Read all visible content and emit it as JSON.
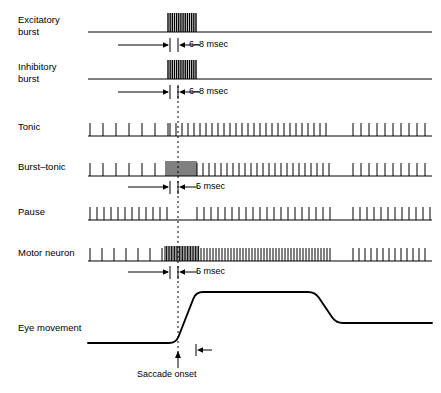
{
  "figure": {
    "background_color": "#ffffff",
    "ink_color": "#000000",
    "width": 441,
    "height": 393
  },
  "saccade_marker": {
    "label": "Saccade onset",
    "x": 178,
    "line_style": "dashed",
    "arrow": "up"
  },
  "rows": [
    {
      "id": "excitatory-burst",
      "label": "Excitatory\nburst",
      "label_x": 18,
      "label_y": 14,
      "baseline_y": 32,
      "trace_type": "burst-packet",
      "annotation": {
        "text": "6–8 msec",
        "left_arrow": true,
        "right_arrow": true,
        "y": 45
      }
    },
    {
      "id": "inhibitory-burst",
      "label": "Inhibitory\nburst",
      "label_x": 18,
      "label_y": 61,
      "baseline_y": 79,
      "trace_type": "burst-packet",
      "annotation": {
        "text": "6–8 msec",
        "left_arrow": true,
        "right_arrow": true,
        "y": 92
      }
    },
    {
      "id": "tonic",
      "label": "Tonic",
      "label_x": 18,
      "label_y": 121,
      "baseline_y": 136,
      "trace_type": "spike-train",
      "annotation": null
    },
    {
      "id": "burst-tonic",
      "label": "Burst–tonic",
      "label_x": 18,
      "label_y": 161,
      "baseline_y": 176,
      "trace_type": "spike-train",
      "annotation": {
        "text": "5 msec",
        "left_arrow": true,
        "right_arrow": true,
        "y": 187
      }
    },
    {
      "id": "pause",
      "label": "Pause",
      "label_x": 18,
      "label_y": 206,
      "baseline_y": 220,
      "trace_type": "spike-train",
      "annotation": null
    },
    {
      "id": "motor-neuron",
      "label": "Motor neuron",
      "label_x": 18,
      "label_y": 247,
      "baseline_y": 261,
      "trace_type": "spike-train",
      "annotation": {
        "text": "5 msec",
        "left_arrow": true,
        "right_arrow": true,
        "y": 272
      }
    },
    {
      "id": "eye-movement",
      "label": "Eye movement",
      "label_x": 18,
      "label_y": 322,
      "baseline_y": 343,
      "trace_type": "waveform",
      "annotation": null
    }
  ],
  "chart_data": {
    "type": "line",
    "xlabel": "",
    "ylabel": "",
    "x_axis_start": 88,
    "x_axis_end": 432,
    "saccade_onset_x": 178,
    "spike_trains": {
      "excitatory_burst": {
        "description": "Silent baseline with a single high-frequency burst just before saccade onset",
        "burst_start": 168,
        "burst_end": 196,
        "burst_spike_count": 14,
        "baseline_active": false
      },
      "inhibitory_burst": {
        "description": "Silent baseline with a single high-frequency burst just before saccade onset",
        "burst_start": 168,
        "burst_end": 196,
        "burst_spike_count": 14,
        "baseline_active": false
      },
      "tonic": {
        "description": "Low-rate tonic firing, increasing to a higher steady rate after the saccade, with a quiet interval then resumed firing",
        "segments": [
          {
            "start": 90,
            "end": 168,
            "rate": "low",
            "spacing": 13
          },
          {
            "start": 170,
            "end": 330,
            "rate": "high",
            "spacing": 6
          },
          {
            "start": 330,
            "end": 352,
            "rate": "silent",
            "spacing": 0
          },
          {
            "start": 353,
            "end": 430,
            "rate": "medium",
            "spacing": 8
          }
        ]
      },
      "burst_tonic": {
        "description": "Low tonic rate, a dense burst at saccade onset, then sustained elevated tonic firing",
        "segments": [
          {
            "start": 90,
            "end": 165,
            "rate": "low",
            "spacing": 13
          },
          {
            "start": 166,
            "end": 196,
            "rate": "burst",
            "spacing": 2
          },
          {
            "start": 197,
            "end": 330,
            "rate": "high",
            "spacing": 6
          },
          {
            "start": 331,
            "end": 352,
            "rate": "silent",
            "spacing": 0
          },
          {
            "start": 353,
            "end": 430,
            "rate": "medium",
            "spacing": 8
          }
        ]
      },
      "pause": {
        "description": "Steady firing that pauses completely during the saccade, then resumes",
        "segments": [
          {
            "start": 90,
            "end": 172,
            "rate": "high",
            "spacing": 7
          },
          {
            "start": 173,
            "end": 196,
            "rate": "silent",
            "spacing": 0
          },
          {
            "start": 197,
            "end": 330,
            "rate": "high",
            "spacing": 7
          },
          {
            "start": 331,
            "end": 352,
            "rate": "silent",
            "spacing": 0
          },
          {
            "start": 353,
            "end": 430,
            "rate": "high",
            "spacing": 7
          }
        ]
      },
      "motor_neuron": {
        "description": "Low tonic rate, intense burst at saccade onset merging into very high frequency tonic firing, then reduced steady rate",
        "segments": [
          {
            "start": 90,
            "end": 164,
            "rate": "low",
            "spacing": 12
          },
          {
            "start": 165,
            "end": 200,
            "rate": "burst",
            "spacing": 1.6
          },
          {
            "start": 201,
            "end": 330,
            "rate": "very-high",
            "spacing": 3
          },
          {
            "start": 331,
            "end": 352,
            "rate": "silent",
            "spacing": 0
          },
          {
            "start": 353,
            "end": 430,
            "rate": "high",
            "spacing": 6
          }
        ]
      }
    },
    "eye_movement": {
      "description": "Flat baseline, rapid step increase at saccade onset, plateau, then a downward step to an intermediate holding level",
      "points": [
        {
          "x": 88,
          "y": 343
        },
        {
          "x": 176,
          "y": 343
        },
        {
          "x": 196,
          "y": 292
        },
        {
          "x": 315,
          "y": 292
        },
        {
          "x": 336,
          "y": 323
        },
        {
          "x": 432,
          "y": 323
        }
      ]
    }
  }
}
